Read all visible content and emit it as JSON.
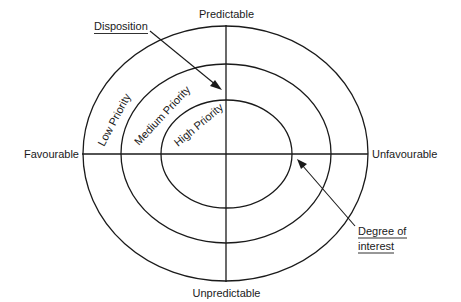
{
  "diagram": {
    "type": "priority-ellipse-matrix",
    "axes": {
      "top": "Predictable",
      "bottom": "Unpredictable",
      "left": "Favourable",
      "right": "Unfavourable"
    },
    "rings": [
      {
        "id": "outer",
        "label": "Low Priority"
      },
      {
        "id": "middle",
        "label": "Medium Priority"
      },
      {
        "id": "inner",
        "label": "High Priority"
      }
    ],
    "callouts": [
      {
        "id": "disposition",
        "lines": [
          "Disposition"
        ],
        "points_to": "middle ring / vertical axis (upper)"
      },
      {
        "id": "degree-of-interest",
        "lines": [
          "Degree of",
          "interest"
        ],
        "points_to": "inner ring / horizontal axis (right)"
      }
    ],
    "colors": {
      "ink": "#1a1a1a",
      "background": "#ffffff"
    }
  }
}
